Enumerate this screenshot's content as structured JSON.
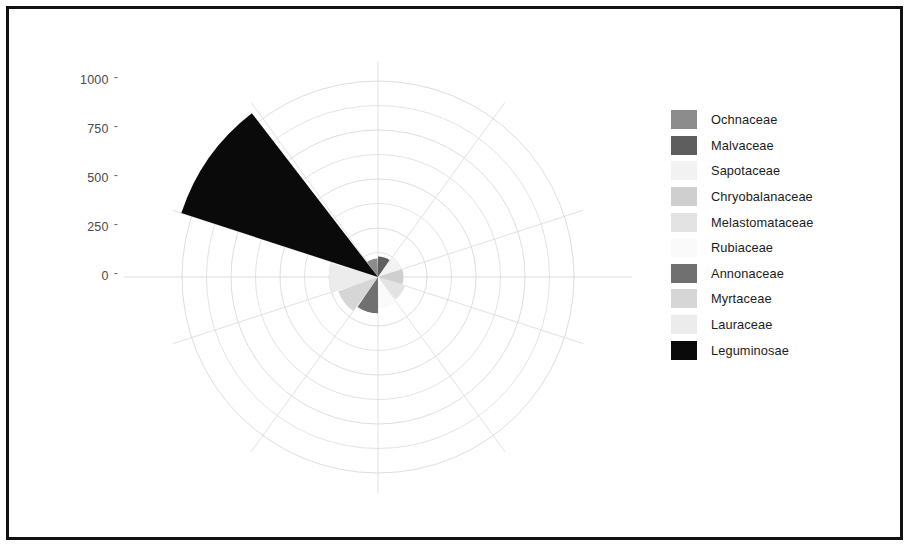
{
  "figure": {
    "background": "#ffffff",
    "frame_color": "#111111",
    "grid_color": "#d9d9d9",
    "axis_label_color": "#4a4a4a"
  },
  "axis": {
    "tick_labels": [
      "1000",
      "750",
      "500",
      "250",
      "0"
    ],
    "tick_values": [
      1000,
      750,
      500,
      250,
      0
    ],
    "tick_mark_glyph": "-"
  },
  "legend": {
    "position": "right",
    "items": [
      {
        "label": "Ochnaceae",
        "color": "#8c8c8c"
      },
      {
        "label": "Malvaceae",
        "color": "#5e5e5e"
      },
      {
        "label": "Sapotaceae",
        "color": "#f2f2f2"
      },
      {
        "label": "Chryobalanaceae",
        "color": "#cfcfcf"
      },
      {
        "label": "Melastomataceae",
        "color": "#e3e3e3"
      },
      {
        "label": "Rubiaceae",
        "color": "#fafafa"
      },
      {
        "label": "Annonaceae",
        "color": "#707070"
      },
      {
        "label": "Myrtaceae",
        "color": "#d6d6d6"
      },
      {
        "label": "Lauraceae",
        "color": "#ececec"
      },
      {
        "label": "Leguminosae",
        "color": "#0a0a0a"
      }
    ]
  },
  "chart_data": {
    "type": "pie",
    "subtype": "polar-rose",
    "title": "",
    "xlabel": "",
    "ylabel": "",
    "rlim": [
      0,
      1100
    ],
    "rticks": [
      0,
      250,
      500,
      750,
      1000
    ],
    "grid": true,
    "sector_count": 10,
    "sector_degrees": 36,
    "start_angle_deg": -36,
    "direction": "clockwise",
    "categories": [
      "Ochnaceae",
      "Malvaceae",
      "Sapotaceae",
      "Chryobalanaceae",
      "Melastomataceae",
      "Rubiaceae",
      "Annonaceae",
      "Myrtaceae",
      "Lauraceae",
      "Leguminosae"
    ],
    "values": [
      95,
      105,
      120,
      130,
      145,
      160,
      185,
      215,
      250,
      1055
    ],
    "colors": [
      "#8c8c8c",
      "#5e5e5e",
      "#f2f2f2",
      "#cfcfcf",
      "#e3e3e3",
      "#fafafa",
      "#707070",
      "#d6d6d6",
      "#ececec",
      "#0a0a0a"
    ],
    "sector_start_deg": [
      0,
      36,
      72,
      108,
      144,
      180,
      216,
      252,
      288,
      324
    ],
    "note": "Radius of each wedge encodes the count; wedges are equal-width 36 degree sectors drawn outward from the pole."
  },
  "geometry": {
    "center_x": 378,
    "center_y": 277,
    "px_per_unit": 0.196,
    "outer_grid_radius_px": 216
  }
}
